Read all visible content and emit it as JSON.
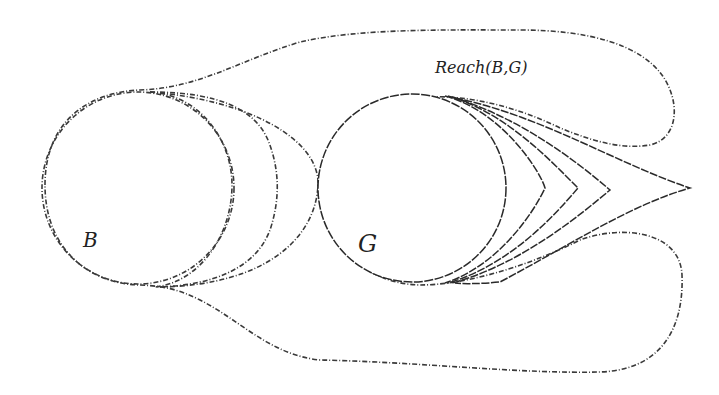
{
  "diagram": {
    "type": "reachability-illustration",
    "labels": {
      "reach_set": "Reach(B,G)",
      "start_set": "B",
      "goal_set": "G"
    },
    "regions": [
      {
        "id": "reach-region",
        "label": "Reach(B,G)",
        "fill": "shaded-dotted"
      },
      {
        "id": "start-set-B",
        "label": "B",
        "shape": "circle",
        "fill": "shaded-dotted"
      },
      {
        "id": "goal-set-G",
        "label": "G",
        "shape": "circle",
        "fill": "white"
      }
    ],
    "intermediate_fronts_from_B": 3,
    "backward_fronts_from_G": 4,
    "colors": {
      "background": "#ffffff",
      "shading": "#d9d9d9",
      "stroke": "#333333",
      "text": "#222222"
    }
  }
}
